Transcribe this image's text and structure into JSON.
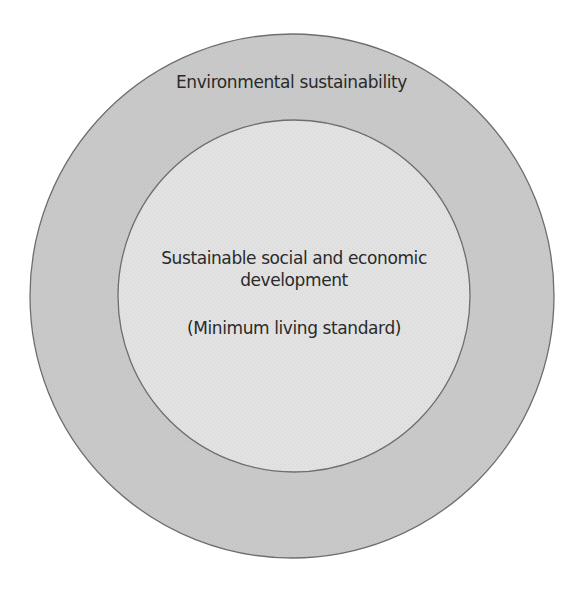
{
  "diagram": {
    "type": "nested-circles",
    "colors": {
      "background": "#ffffff",
      "outer_fill": "#c9c9c9",
      "inner_fill": "#e2e2e2",
      "stroke": "#6e6e6e",
      "text": "#2a2a2a"
    },
    "outer": {
      "label": "Environmental sustainability"
    },
    "inner": {
      "label_line1": "Sustainable social and economic",
      "label_line2": "development",
      "sublabel": "(Minimum living standard)"
    }
  }
}
